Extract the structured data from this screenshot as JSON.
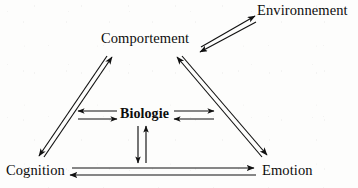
{
  "diagram": {
    "type": "cycle-triangle",
    "background_color": "#fdfdfc",
    "line_color": "#111111",
    "nodes": [
      {
        "id": "comportement",
        "label": "Comportement",
        "position": "top-apex"
      },
      {
        "id": "environnement",
        "label": "Environnement",
        "position": "top-right-outer"
      },
      {
        "id": "biologie",
        "label": "Biologie",
        "position": "center"
      },
      {
        "id": "cognition",
        "label": "Cognition",
        "position": "bottom-left"
      },
      {
        "id": "emotion",
        "label": "Emotion",
        "position": "bottom-right"
      }
    ],
    "edges": [
      {
        "from": "comportement",
        "to": "environnement",
        "style": "double-line-bidirectional"
      },
      {
        "from": "comportement",
        "to": "cognition",
        "style": "double-line-bidirectional"
      },
      {
        "from": "comportement",
        "to": "emotion",
        "style": "double-line-bidirectional"
      },
      {
        "from": "cognition",
        "to": "emotion",
        "style": "double-line-bidirectional"
      },
      {
        "from": "biologie",
        "to": "cognition",
        "style": "double-line-bidirectional"
      },
      {
        "from": "biologie",
        "to": "emotion",
        "style": "double-line-bidirectional"
      },
      {
        "from": "biologie",
        "to": "bottom-edge",
        "style": "double-line-bidirectional"
      }
    ]
  }
}
